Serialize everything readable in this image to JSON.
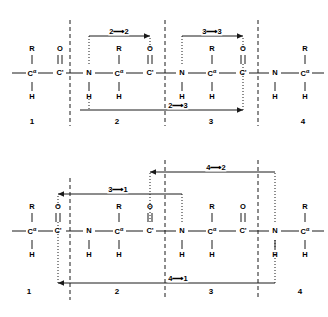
{
  "figure": {
    "type": "chemical-structure-diagram",
    "panels": [
      "top",
      "bottom"
    ]
  },
  "atoms": {
    "c_alpha": "C",
    "alpha": "α",
    "c_prime": "C'",
    "nitrogen": "N",
    "oxygen": "O",
    "hydrogen": "H",
    "sidechain": "R"
  },
  "residue_numbers": [
    "1",
    "2",
    "3",
    "4"
  ],
  "top_panel": {
    "residue_labels": [
      "1",
      "2",
      "3",
      "4"
    ],
    "arrows": [
      {
        "label": "2⟶2",
        "from": "2",
        "to": "2",
        "position": "above",
        "direction": "right"
      },
      {
        "label": "3⟶3",
        "from": "3",
        "to": "3",
        "position": "above",
        "direction": "right"
      },
      {
        "label": "2⟶3",
        "from": "2",
        "to": "3",
        "position": "below",
        "direction": "right"
      }
    ],
    "chain_atoms": [
      {
        "id": "r1-ca",
        "label": "C",
        "alpha": true,
        "up": "R",
        "down": "H"
      },
      {
        "id": "r1-cp",
        "label": "C'",
        "up": "O",
        "bond": "double"
      },
      {
        "id": "r2-n",
        "label": "N",
        "down": "H"
      },
      {
        "id": "r2-ca",
        "label": "C",
        "alpha": true,
        "up": "R",
        "down": "H"
      },
      {
        "id": "r2-cp",
        "label": "C'",
        "up": "O",
        "bond": "double"
      },
      {
        "id": "r3-n",
        "label": "N",
        "down": "H"
      },
      {
        "id": "r3-ca",
        "label": "C",
        "alpha": true,
        "up": "R",
        "down": "H"
      },
      {
        "id": "r3-cp",
        "label": "C'",
        "up": "O",
        "bond": "double"
      },
      {
        "id": "r4-n",
        "label": "N",
        "down": "H"
      },
      {
        "id": "r4-ca",
        "label": "C",
        "alpha": true,
        "up": "R",
        "down": "H"
      }
    ]
  },
  "bottom_panel": {
    "residue_labels": [
      "1",
      "2",
      "3",
      "4"
    ],
    "arrows": [
      {
        "label": "3⟶1",
        "from": "3",
        "to": "1",
        "position": "above",
        "direction": "left"
      },
      {
        "label": "4⟶2",
        "from": "4",
        "to": "2",
        "position": "above",
        "direction": "left"
      },
      {
        "label": "4⟶1",
        "from": "4",
        "to": "1",
        "position": "below",
        "direction": "left"
      }
    ],
    "chain_atoms": [
      {
        "id": "r1-ca",
        "label": "C",
        "alpha": true,
        "up": "R",
        "down": "H"
      },
      {
        "id": "r1-cp",
        "label": "C'",
        "up": "O",
        "bond": "double"
      },
      {
        "id": "r2-n",
        "label": "N",
        "down": "H"
      },
      {
        "id": "r2-ca",
        "label": "C",
        "alpha": true,
        "up": "R",
        "down": "H"
      },
      {
        "id": "r2-cp",
        "label": "C'",
        "up": "O",
        "bond": "double"
      },
      {
        "id": "r3-n",
        "label": "N",
        "down": "H"
      },
      {
        "id": "r3-ca",
        "label": "C",
        "alpha": true,
        "up": "R",
        "down": "H"
      },
      {
        "id": "r3-cp",
        "label": "C'",
        "up": "O",
        "bond": "double"
      },
      {
        "id": "r4-n",
        "label": "N",
        "down": "H"
      },
      {
        "id": "r4-ca",
        "label": "C",
        "alpha": true,
        "up": "R",
        "down": "H"
      }
    ]
  },
  "colors": {
    "stroke": "#1a1a1a",
    "background": "#ffffff"
  }
}
